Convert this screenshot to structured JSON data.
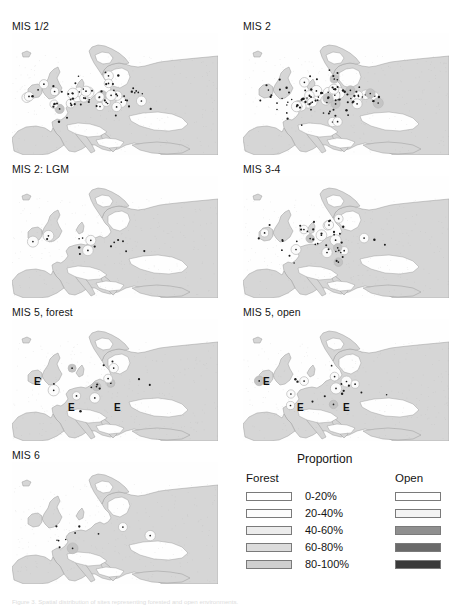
{
  "figure": {
    "caption": "Figure 3. Spatial distribution of sites representing forested and open environments."
  },
  "panels": [
    {
      "id": "mis-1-2",
      "title": "MIS 1/2",
      "col": 0,
      "row": 0,
      "markers": 23,
      "dots": 46,
      "e_labels": []
    },
    {
      "id": "mis-2",
      "title": "MIS 2",
      "col": 1,
      "row": 0,
      "markers": 26,
      "dots": 74,
      "e_labels": []
    },
    {
      "id": "mis-2-lgm",
      "title": "MIS 2: LGM",
      "col": 0,
      "row": 1,
      "markers": 4,
      "dots": 12,
      "e_labels": []
    },
    {
      "id": "mis-3-4",
      "title": "MIS 3-4",
      "col": 1,
      "row": 1,
      "markers": 14,
      "dots": 33,
      "e_labels": []
    },
    {
      "id": "mis-5-forest",
      "title": "MIS 5, forest",
      "col": 0,
      "row": 2,
      "markers": 9,
      "dots": 10,
      "e_labels": [
        {
          "label": "E",
          "x": 22,
          "y": 58
        },
        {
          "label": "E",
          "x": 56,
          "y": 84
        },
        {
          "label": "E",
          "x": 102,
          "y": 84
        }
      ]
    },
    {
      "id": "mis-5-open",
      "title": "MIS 5, open",
      "col": 1,
      "row": 2,
      "markers": 9,
      "dots": 11,
      "e_labels": [
        {
          "label": "E",
          "x": 20,
          "y": 58
        },
        {
          "label": "E",
          "x": 54,
          "y": 84
        },
        {
          "label": "E",
          "x": 100,
          "y": 84
        }
      ]
    },
    {
      "id": "mis-6",
      "title": "MIS 6",
      "col": 0,
      "row": 3,
      "markers": 3,
      "dots": 8,
      "e_labels": []
    }
  ],
  "legend": {
    "title": "Proportion",
    "forest_header": "Forest",
    "open_header": "Open",
    "rows": [
      {
        "label": "0-20%",
        "forest_color": "#ffffff",
        "open_color": "#ffffff"
      },
      {
        "label": "20-40%",
        "forest_color": "#fcfcfc",
        "open_color": "#f4f4f4"
      },
      {
        "label": "40-60%",
        "forest_color": "#ececec",
        "open_color": "#8f8f8f"
      },
      {
        "label": "60-80%",
        "forest_color": "#dcdcdc",
        "open_color": "#6a6a6a"
      },
      {
        "label": "80-100%",
        "forest_color": "#cfcfcf",
        "open_color": "#3a3a3a"
      }
    ]
  },
  "map_style": {
    "land_color": "#d6d6d6",
    "sea_color": "#fefefe",
    "coast_color": "#9a9a9a",
    "marker_ring_color": "#b9b9b9",
    "marker_fill_color": "#fbfbfb",
    "dot_color": "#1c1c1c"
  }
}
